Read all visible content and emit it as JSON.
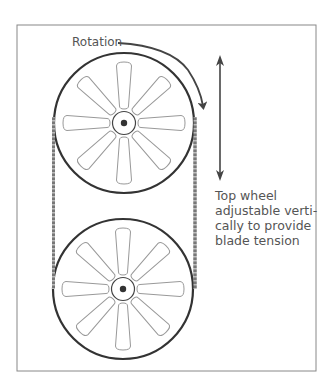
{
  "labels": {
    "rotation": "Rotation",
    "caption_lines": [
      "Top wheel",
      "adjustable verti-",
      "cally to provide",
      "blade tension"
    ]
  },
  "colors": {
    "frame": "#888888",
    "wheel_rim": "#333333",
    "spoke": "#999999",
    "blade": "#666666",
    "arrow": "#444444",
    "text": "#555555"
  },
  "geometry": {
    "frame": {
      "x": 17,
      "y": 25,
      "w": 299,
      "h": 346
    },
    "wheels": [
      {
        "name": "top-wheel",
        "cx": 124,
        "cy": 123,
        "r": 70
      },
      {
        "name": "bottom-wheel",
        "cx": 123,
        "cy": 289,
        "r": 70
      }
    ],
    "spoke_count": 8
  }
}
